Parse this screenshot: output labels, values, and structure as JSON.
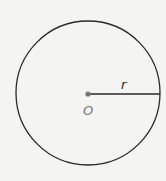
{
  "diagram": {
    "type": "circle",
    "center_label": "O",
    "radius_label": "r",
    "colors": {
      "background": "#f4f4f2",
      "stroke": "#2a2a2a",
      "center_dot": "#777777",
      "label_gray": "#7a7a7a",
      "label_dark": "#2a2a2a"
    }
  }
}
